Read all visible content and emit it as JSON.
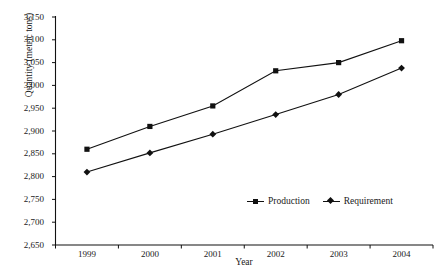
{
  "chart_data": {
    "type": "line",
    "title": "",
    "xlabel": "Year",
    "ylabel": "Quantity (metric tons)",
    "categories": [
      "1999",
      "2000",
      "2001",
      "2002",
      "2003",
      "2004"
    ],
    "ylim": [
      2650,
      3150
    ],
    "yticks": [
      2650,
      2700,
      2750,
      2800,
      2850,
      2900,
      2950,
      3000,
      3050,
      3100,
      3150
    ],
    "ytick_labels": [
      "2,650",
      "2,700",
      "2,750",
      "2,800",
      "2,850",
      "2,900",
      "2,950",
      "3,000",
      "3,050",
      "3,100",
      "3,150"
    ],
    "grid": false,
    "legend_position": "inside-lower-right",
    "series": [
      {
        "name": "Production",
        "marker": "square",
        "color": "#111111",
        "values": [
          2860,
          2910,
          2955,
          3032,
          3050,
          3098
        ]
      },
      {
        "name": "Requirement",
        "marker": "diamond",
        "color": "#111111",
        "values": [
          2810,
          2852,
          2893,
          2936,
          2980,
          3038
        ]
      }
    ]
  },
  "legend": {
    "production_label": "Production",
    "requirement_label": "Requirement"
  },
  "axes": {
    "y_title": "Quantity (metric tons)",
    "x_title": "Year"
  }
}
